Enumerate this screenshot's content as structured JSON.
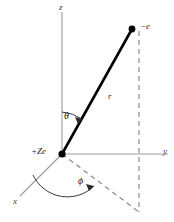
{
  "figure": {
    "type": "spherical-coordinate-diagram",
    "background_color": "#ffffff"
  },
  "axes": {
    "z": {
      "label": "z",
      "color": "#9a9a9a"
    },
    "y": {
      "label": "y",
      "color": "#9a9a9a"
    },
    "x": {
      "label": "x",
      "color": "#9a9a9a"
    }
  },
  "points": {
    "origin": {
      "label": "+Ze",
      "color": "#000000"
    },
    "electron": {
      "label": "−e",
      "color": "#000000"
    }
  },
  "vector": {
    "label": "r",
    "color": "#000000"
  },
  "angles": {
    "theta": {
      "label": "θ",
      "color": "#1a1a1a"
    },
    "phi": {
      "label": "ϕ",
      "color": "#1a1a1a"
    }
  },
  "projection": {
    "style": "dashed",
    "color": "#8c8c8c"
  }
}
